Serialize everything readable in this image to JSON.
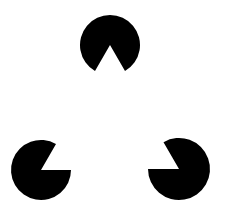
{
  "figure": {
    "type": "kanizsa-triangle",
    "background_color": "#ffffff",
    "shape_color": "#000000",
    "inducers": [
      {
        "name": "top",
        "cx": 110,
        "cy": 45,
        "r": 30,
        "wedge_direction_deg": 90,
        "wedge_angle_deg": 60
      },
      {
        "name": "bottom-left",
        "cx": 41,
        "cy": 170,
        "r": 30,
        "wedge_direction_deg": -30,
        "wedge_angle_deg": 60
      },
      {
        "name": "bottom-right",
        "cx": 179,
        "cy": 169,
        "r": 31,
        "wedge_direction_deg": 210,
        "wedge_angle_deg": 60
      }
    ]
  }
}
